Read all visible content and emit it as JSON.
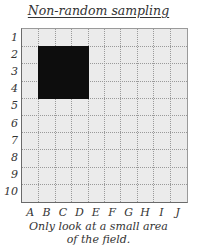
{
  "title": "Non-random sampling",
  "grid": {
    "rows": [
      "1",
      "2",
      "3",
      "4",
      "5",
      "6",
      "7",
      "8",
      "9",
      "10"
    ],
    "columns": [
      "A",
      "B",
      "C",
      "D",
      "E",
      "F",
      "G",
      "H",
      "I",
      "J"
    ],
    "sampled_area": {
      "columns": [
        "B",
        "C",
        "D"
      ],
      "rows": [
        "2",
        "3",
        "4"
      ]
    },
    "colors": {
      "cell_fill": "#ebebeb",
      "sampled_fill": "#0d0d0d",
      "border": "#6a6a6a",
      "gridline": "#9a9a9a"
    }
  },
  "caption": {
    "line1": "Only look at a small area",
    "line2": "of the field."
  }
}
